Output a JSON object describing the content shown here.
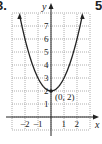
{
  "problem_number_left": "3.",
  "problem_number_right": "5",
  "chart_data": {
    "type": "line",
    "title": "",
    "function": "y = x^2 + 2",
    "xlabel": "x",
    "ylabel": "y",
    "xlim": [
      -3,
      3
    ],
    "ylim": [
      -1,
      8
    ],
    "x_ticks": [
      "-2",
      "-1",
      "1",
      "2"
    ],
    "y_ticks": [
      "1",
      "2",
      "3",
      "4",
      "5",
      "6",
      "7"
    ],
    "grid": true,
    "grid_style": "dotted",
    "series": [
      {
        "name": "parabola",
        "x": [
          -2.4,
          -2,
          -1,
          0,
          1,
          2,
          2.4
        ],
        "y": [
          7.76,
          6,
          3,
          2,
          3,
          6,
          7.76
        ]
      }
    ],
    "annotations": [
      {
        "text": "(0, 2)",
        "x": 0,
        "y": 2
      }
    ],
    "line_color": "#222222"
  }
}
